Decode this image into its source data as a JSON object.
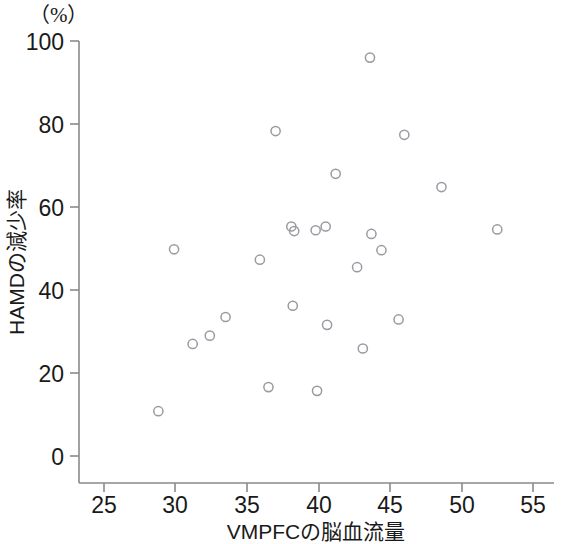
{
  "chart_data": {
    "type": "scatter",
    "title": "",
    "unit_annotation": "（%）",
    "xlabel": "VMPFCの脳血流量",
    "ylabel": "HAMDの減少率",
    "xlim": [
      23.0,
      56.5
    ],
    "ylim": [
      -3.0,
      103.0
    ],
    "xticks": [
      25,
      30,
      35,
      40,
      45,
      50,
      55
    ],
    "yticks": [
      0,
      20,
      40,
      60,
      80,
      100
    ],
    "xtick_labels": [
      "25",
      "30",
      "35",
      "40",
      "45",
      "50",
      "55"
    ],
    "ytick_labels": [
      "0",
      "20",
      "40",
      "60",
      "80",
      "100"
    ],
    "grid": false,
    "legend": null,
    "marker": "open-circle",
    "marker_color": "#9a9aa2",
    "points": [
      {
        "x": 28.8,
        "y": 10.8
      },
      {
        "x": 31.2,
        "y": 27.0
      },
      {
        "x": 32.4,
        "y": 29.0
      },
      {
        "x": 33.5,
        "y": 33.5
      },
      {
        "x": 29.9,
        "y": 49.8
      },
      {
        "x": 35.9,
        "y": 47.3
      },
      {
        "x": 36.5,
        "y": 16.6
      },
      {
        "x": 37.0,
        "y": 78.3
      },
      {
        "x": 38.2,
        "y": 36.2
      },
      {
        "x": 39.9,
        "y": 15.7
      },
      {
        "x": 38.1,
        "y": 55.3
      },
      {
        "x": 38.3,
        "y": 54.2
      },
      {
        "x": 39.8,
        "y": 54.4
      },
      {
        "x": 40.5,
        "y": 55.3
      },
      {
        "x": 40.6,
        "y": 31.6
      },
      {
        "x": 41.2,
        "y": 68.0
      },
      {
        "x": 42.7,
        "y": 45.5
      },
      {
        "x": 43.1,
        "y": 25.9
      },
      {
        "x": 43.6,
        "y": 96.0
      },
      {
        "x": 43.7,
        "y": 53.5
      },
      {
        "x": 44.4,
        "y": 49.6
      },
      {
        "x": 45.6,
        "y": 32.9
      },
      {
        "x": 46.0,
        "y": 77.4
      },
      {
        "x": 48.6,
        "y": 64.8
      },
      {
        "x": 52.5,
        "y": 54.6
      }
    ]
  },
  "axes_geometry": {
    "plot_left": 79,
    "plot_right": 554,
    "plot_top": 41,
    "plot_bottom": 483,
    "y_zero_px": 456,
    "y_hundred_px": 41,
    "x_25_px": 104,
    "x_55_px": 533
  }
}
